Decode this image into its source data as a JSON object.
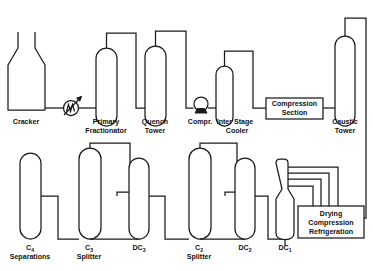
{
  "diagram": {
    "type": "process-flow-diagram",
    "background_color": "#ffffff",
    "line_color": "#1a1a1a",
    "text_color": "#111111",
    "units": [
      {
        "id": "cracker",
        "label": "Cracker",
        "symbol": "furnace-flask",
        "label_lines": [
          "Cracker"
        ],
        "row": "top"
      },
      {
        "id": "heat-exchanger",
        "label": "",
        "symbol": "heat-exchanger-coil-arrow",
        "label_lines": [],
        "row": "top"
      },
      {
        "id": "primary-fractionator",
        "label": "Primary Fractionator",
        "symbol": "column",
        "label_lines": [
          "Primary",
          "Fractionator"
        ],
        "row": "top"
      },
      {
        "id": "quench-tower",
        "label": "Quench Tower",
        "symbol": "column",
        "label_lines": [
          "Quench",
          "Tower"
        ],
        "row": "top"
      },
      {
        "id": "compressor",
        "label": "Compr.",
        "symbol": "compressor-circle-base",
        "label_lines": [
          "Compr."
        ],
        "row": "top"
      },
      {
        "id": "inter-stage-cooler",
        "label": "Inter Stage Cooler",
        "symbol": "column",
        "label_lines": [
          "Inter Stage",
          "Cooler"
        ],
        "row": "top"
      },
      {
        "id": "compression-section",
        "label": "Compression Section",
        "symbol": "rectangle-box",
        "label_lines": [
          "Compression",
          "Section"
        ],
        "row": "top"
      },
      {
        "id": "caustic-tower",
        "label": "Caustic Tower",
        "symbol": "column",
        "label_lines": [
          "Caustic",
          "Tower"
        ],
        "row": "top"
      },
      {
        "id": "c4-separations",
        "label": "C4 Separations",
        "symbol": "column",
        "label_lines": [
          "C",
          "Separations"
        ],
        "label_base": "C",
        "label_subscript": "4",
        "row": "bottom"
      },
      {
        "id": "c3-splitter",
        "label": "C3 Splitter",
        "symbol": "column",
        "label_lines": [
          "C",
          "Splitter"
        ],
        "label_base": "C",
        "label_subscript": "3",
        "row": "bottom"
      },
      {
        "id": "dc3",
        "label": "DC3",
        "symbol": "column",
        "label_base": "DC",
        "label_subscript": "3",
        "row": "bottom"
      },
      {
        "id": "c2-splitter",
        "label": "C2 Splitter",
        "symbol": "column",
        "label_lines": [
          "C",
          "Splitter"
        ],
        "label_base": "C",
        "label_subscript": "2",
        "row": "bottom"
      },
      {
        "id": "dc2",
        "label": "DC2",
        "symbol": "column",
        "label_base": "DC",
        "label_subscript": "2",
        "row": "bottom"
      },
      {
        "id": "dc1",
        "label": "DC1",
        "symbol": "tapered-column",
        "label_base": "DC",
        "label_subscript": "1",
        "row": "bottom"
      },
      {
        "id": "drying-compression-refrigeration",
        "label": "Drying Compression Refrigeration",
        "symbol": "rectangle-box",
        "label_lines": [
          "Drying",
          "Compression",
          "Refrigeration"
        ],
        "row": "bottom"
      }
    ],
    "labels": {
      "cracker": "Cracker",
      "primary_fractionator_l1": "Primary",
      "primary_fractionator_l2": "Fractionator",
      "quench_tower_l1": "Quench",
      "quench_tower_l2": "Tower",
      "compressor": "Compr.",
      "inter_stage_cooler_l1": "Inter Stage",
      "inter_stage_cooler_l2": "Cooler",
      "compression_section_l1": "Compression",
      "compression_section_l2": "Section",
      "caustic_tower_l1": "Caustic",
      "caustic_tower_l2": "Tower",
      "c4_base": "C",
      "c4_sub": "4",
      "separations": "Separations",
      "c3_base": "C",
      "c3_sub": "3",
      "c3_splitter": "Splitter",
      "dc3_base": "DC",
      "dc3_sub": "3",
      "c2_base": "C",
      "c2_sub": "2",
      "c2_splitter": "Splitter",
      "dc2_base": "DC",
      "dc2_sub": "2",
      "dc1_base": "DC",
      "dc1_sub": "1",
      "drying_l1": "Drying",
      "drying_l2": "Compression",
      "drying_l3": "Refrigeration"
    }
  }
}
